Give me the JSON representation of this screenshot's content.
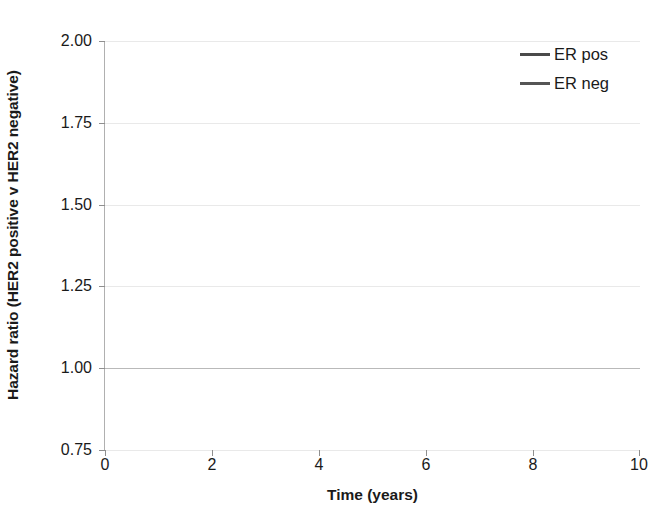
{
  "chart_data": {
    "type": "line",
    "title": "",
    "xlabel": "Time (years)",
    "ylabel": "Hazard ratio (HER2 positive v HER2 negative)",
    "xlim": [
      0,
      10
    ],
    "ylim": [
      0.75,
      2.0
    ],
    "xticks": [
      "0",
      "2",
      "4",
      "6",
      "8",
      "10"
    ],
    "xtick_values": [
      0,
      2,
      4,
      6,
      8,
      10
    ],
    "yticks": [
      "0.75",
      "1.00",
      "1.25",
      "1.50",
      "1.75",
      "2.00"
    ],
    "ytick_values": [
      0.75,
      1.0,
      1.25,
      1.5,
      1.75,
      2.0
    ],
    "grid": true,
    "grid_axis": "y",
    "legend_position": "top-right",
    "reference_line_value": 1.0,
    "crossover_x": 4.25,
    "crossover_y": 1.4,
    "series": [
      {
        "name": "ER pos",
        "color": "#4a4a4a",
        "x": [
          0,
          0.5,
          1,
          1.5,
          2,
          2.5,
          3,
          3.5,
          4,
          4.25,
          4.5,
          5,
          5.5,
          6,
          6.5,
          7,
          7.5,
          8,
          8.5,
          9
        ],
        "values": [
          1.92,
          1.865,
          1.81,
          1.755,
          1.7,
          1.645,
          1.59,
          1.535,
          1.475,
          1.4,
          1.42,
          1.365,
          1.31,
          1.26,
          1.205,
          1.15,
          1.105,
          1.06,
          1.02,
          0.98
        ]
      },
      {
        "name": "ER neg",
        "color": "#555555",
        "x": [
          0,
          9
        ],
        "values": [
          1.4,
          1.4
        ]
      }
    ],
    "legend": [
      {
        "label": "ER pos",
        "color": "#4a4a4a"
      },
      {
        "label": "ER neg",
        "color": "#555555"
      }
    ]
  },
  "axes": {
    "y_title": "Hazard ratio (HER2 positive v HER2 negative)",
    "x_title": "Time (years)"
  }
}
